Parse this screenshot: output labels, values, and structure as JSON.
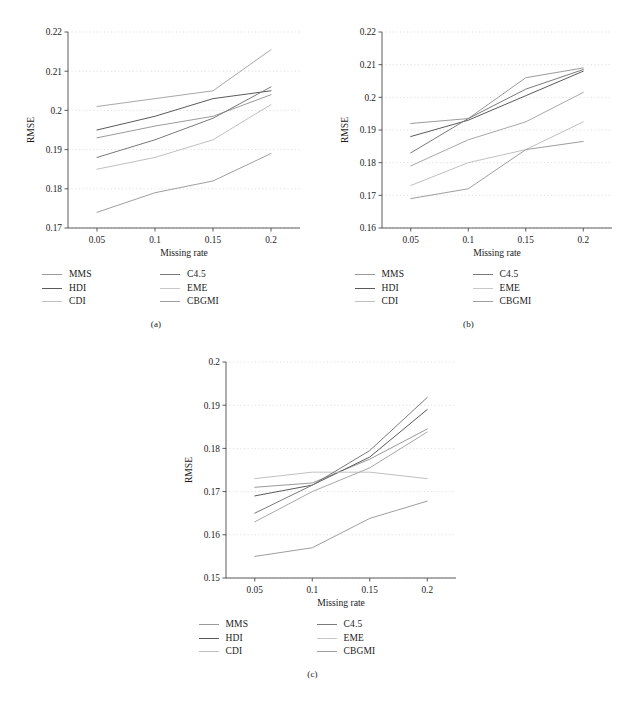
{
  "figure": {
    "panels": [
      {
        "id": "a",
        "caption": "(a)",
        "chart_data": {
          "type": "line",
          "title": "",
          "xlabel": "Missing rate",
          "ylabel": "RMSE",
          "x": [
            0.05,
            0.1,
            0.15,
            0.2
          ],
          "xtick_labels": [
            "0.05",
            "0.1",
            "0.15",
            "0.2"
          ],
          "xlim": [
            0.025,
            0.225
          ],
          "ylim": [
            0.17,
            0.22
          ],
          "ytick_labels": [
            "0.17",
            "0.18",
            "0.19",
            "0.2",
            "0.21",
            "0.22"
          ],
          "yticks": [
            0.17,
            0.18,
            0.19,
            0.2,
            0.21,
            0.22
          ],
          "grid": true,
          "legend_position": "below",
          "series": [
            {
              "name": "MMS",
              "color": "#9a9a9a",
              "values": [
                0.193,
                0.196,
                0.1985,
                0.204
              ]
            },
            {
              "name": "HDI",
              "color": "#5a5a5a",
              "values": [
                0.195,
                0.1985,
                0.203,
                0.205
              ]
            },
            {
              "name": "CDI",
              "color": "#c0c0c0",
              "values": [
                0.185,
                0.188,
                0.1925,
                0.2015
              ]
            },
            {
              "name": "C4.5",
              "color": "#7a7a7a",
              "values": [
                0.188,
                0.1925,
                0.198,
                0.206
              ]
            },
            {
              "name": "EME",
              "color": "#a8a8a8",
              "values": [
                0.201,
                0.203,
                0.205,
                0.2155
              ]
            },
            {
              "name": "CBGMI",
              "color": "#9e9e9e",
              "values": [
                0.174,
                0.179,
                0.182,
                0.189
              ]
            }
          ]
        },
        "legend": {
          "left": [
            "MMS",
            "HDI",
            "CDI"
          ],
          "right": [
            "C4.5",
            "EME",
            "CBGMI"
          ]
        }
      },
      {
        "id": "b",
        "caption": "(b)",
        "chart_data": {
          "type": "line",
          "title": "",
          "xlabel": "Missing rate",
          "ylabel": "RMSE",
          "x": [
            0.05,
            0.1,
            0.15,
            0.2
          ],
          "xtick_labels": [
            "0.05",
            "0.1",
            "0.15",
            "0.2"
          ],
          "xlim": [
            0.025,
            0.225
          ],
          "ylim": [
            0.16,
            0.22
          ],
          "ytick_labels": [
            "0.16",
            "0.17",
            "0.18",
            "0.19",
            "0.2",
            "0.21",
            "0.22"
          ],
          "yticks": [
            0.16,
            0.17,
            0.18,
            0.19,
            0.2,
            0.21,
            0.22
          ],
          "grid": true,
          "legend_position": "below",
          "series": [
            {
              "name": "MMS",
              "color": "#9a9a9a",
              "values": [
                0.192,
                0.1935,
                0.206,
                0.209
              ]
            },
            {
              "name": "HDI",
              "color": "#5a5a5a",
              "values": [
                0.188,
                0.193,
                0.2005,
                0.208
              ]
            },
            {
              "name": "CDI",
              "color": "#c0c0c0",
              "values": [
                0.173,
                0.18,
                0.184,
                0.1925
              ]
            },
            {
              "name": "C4.5",
              "color": "#7a7a7a",
              "values": [
                0.183,
                0.1935,
                0.2025,
                0.2085
              ]
            },
            {
              "name": "EME",
              "color": "#a8a8a8",
              "values": [
                0.179,
                0.187,
                0.1925,
                0.2015
              ]
            },
            {
              "name": "CBGMI",
              "color": "#9e9e9e",
              "values": [
                0.169,
                0.172,
                0.184,
                0.1865
              ]
            }
          ]
        },
        "legend": {
          "left": [
            "MMS",
            "HDI",
            "CDI"
          ],
          "right": [
            "C4.5",
            "EME",
            "CBGMI"
          ]
        }
      },
      {
        "id": "c",
        "caption": "(c)",
        "chart_data": {
          "type": "line",
          "title": "",
          "xlabel": "Missing rate",
          "ylabel": "RMSE",
          "x": [
            0.05,
            0.1,
            0.15,
            0.2
          ],
          "xtick_labels": [
            "0.05",
            "0.1",
            "0.15",
            "0.2"
          ],
          "xlim": [
            0.025,
            0.225
          ],
          "ylim": [
            0.15,
            0.2
          ],
          "ytick_labels": [
            "0.15",
            "0.16",
            "0.17",
            "0.18",
            "0.19",
            "0.2"
          ],
          "yticks": [
            0.15,
            0.16,
            0.17,
            0.18,
            0.19,
            0.2
          ],
          "grid": true,
          "legend_position": "below",
          "series": [
            {
              "name": "MMS",
              "color": "#9a9a9a",
              "values": [
                0.171,
                0.172,
                0.1775,
                0.1845
              ]
            },
            {
              "name": "HDI",
              "color": "#5a5a5a",
              "values": [
                0.169,
                0.1715,
                0.178,
                0.189
              ]
            },
            {
              "name": "CDI",
              "color": "#c0c0c0",
              "values": [
                0.173,
                0.1745,
                0.1745,
                0.173
              ]
            },
            {
              "name": "C4.5",
              "color": "#7a7a7a",
              "values": [
                0.165,
                0.1715,
                0.1795,
                0.1918
              ]
            },
            {
              "name": "EME",
              "color": "#a8a8a8",
              "values": [
                0.163,
                0.17,
                0.1755,
                0.1838
              ]
            },
            {
              "name": "CBGMI",
              "color": "#9e9e9e",
              "values": [
                0.155,
                0.157,
                0.1638,
                0.1678
              ]
            }
          ]
        },
        "legend": {
          "left": [
            "MMS",
            "HDI",
            "CDI"
          ],
          "right": [
            "C4.5",
            "EME",
            "CBGMI"
          ]
        }
      }
    ]
  }
}
